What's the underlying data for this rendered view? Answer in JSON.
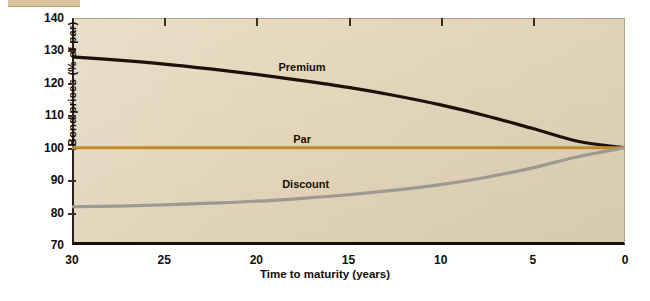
{
  "figure": {
    "background_color": "#ffffff",
    "plot_background_color": "#e3d5b8",
    "axis_color": "#16100a"
  },
  "chart_data": {
    "type": "line",
    "title": "",
    "xlabel": "Time to maturity (years)",
    "ylabel": "Bond prices (% of par)",
    "xlim": [
      30,
      0
    ],
    "ylim": [
      70,
      140
    ],
    "x_reversed": true,
    "grid": false,
    "legend": "inline-annotations",
    "xticks": [
      30,
      25,
      20,
      15,
      10,
      5,
      0
    ],
    "xtick_labels": [
      "30",
      "25",
      "20",
      "15",
      "10",
      "5",
      "0"
    ],
    "yticks": [
      70,
      80,
      90,
      100,
      110,
      120,
      130,
      140
    ],
    "ytick_labels": [
      "70",
      "80",
      "90",
      "100",
      "110",
      "120",
      "130",
      "140"
    ],
    "x": [
      30,
      27.5,
      25,
      22.5,
      20,
      17.5,
      15,
      12.5,
      10,
      7.5,
      5,
      2.5,
      0
    ],
    "series": [
      {
        "name": "Premium",
        "color": "#1c1209",
        "width": 3.2,
        "label_text": "Premium",
        "values": [
          128.0,
          127.0,
          125.8,
          124.3,
          122.6,
          120.7,
          118.6,
          116.1,
          113.2,
          109.8,
          105.9,
          101.9,
          100.0
        ]
      },
      {
        "name": "Par",
        "color": "#c3882a",
        "width": 3.0,
        "label_text": "Par",
        "values": [
          100,
          100,
          100,
          100,
          100,
          100,
          100,
          100,
          100,
          100,
          100,
          100,
          100
        ]
      },
      {
        "name": "Discount",
        "color": "#9e9a92",
        "width": 3.2,
        "label_text": "Discount",
        "values": [
          81.8,
          82.0,
          82.4,
          82.9,
          83.5,
          84.4,
          85.5,
          86.9,
          88.6,
          90.9,
          93.8,
          97.3,
          100.0
        ]
      }
    ],
    "annotations": [
      {
        "text": "Premium",
        "x": 18.8,
        "y": 124.5
      },
      {
        "text": "Par",
        "x": 18.0,
        "y": 102.5
      },
      {
        "text": "Discount",
        "x": 18.6,
        "y": 88.5
      }
    ]
  }
}
